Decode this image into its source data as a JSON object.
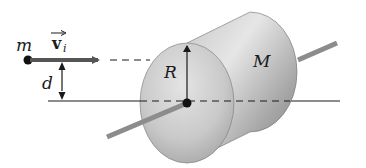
{
  "diagram": {
    "title": "",
    "labels": {
      "particle_mass": "m",
      "velocity_symbol": "v",
      "velocity_subscript": "i",
      "offset_distance": "d",
      "radius": "R",
      "cylinder_mass": "M"
    },
    "colors": {
      "background": "#ffffff",
      "line": "#1a1a1a",
      "velocity_arrow": "#555555",
      "cylinder_light": "#d9d9d9",
      "cylinder_dark": "#8a8a8a",
      "axle": "#8c8c8c"
    },
    "elements": [
      "particle m moving with velocity v_i",
      "dashed line of travel toward cylinder",
      "perpendicular distance d from axis",
      "solid cylinder of mass M and radius R",
      "axle through cylinder center",
      "horizontal reference line through axis"
    ]
  }
}
